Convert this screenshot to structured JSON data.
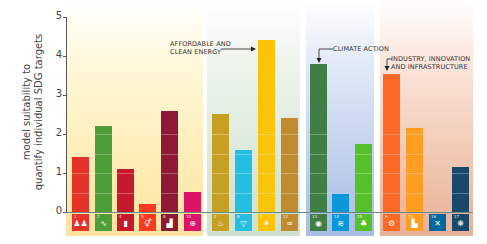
{
  "chart_data": {
    "type": "bar",
    "title": "",
    "xlabel": "",
    "ylabel": "model suitability to quantify individual SDG targets",
    "ylim": [
      0,
      5
    ],
    "yticks": [
      0,
      1,
      2,
      3,
      4,
      5
    ],
    "grid": false,
    "legend": null,
    "categories": [
      "SDG 1",
      "SDG 2",
      "SDG 4",
      "SDG 5",
      "SDG 8",
      "SDG 10",
      "SDG 6",
      "SDG 14",
      "SDG 7",
      "SDG 12",
      "SDG 13",
      "SDG 14b",
      "SDG 15",
      "SDG 9",
      "SDG 11",
      "SDG 16",
      "SDG 17"
    ],
    "groups": [
      {
        "name": "social",
        "bars": [
          0,
          1,
          2,
          3,
          4,
          5
        ]
      },
      {
        "name": "resources",
        "bars": [
          6,
          7,
          8,
          9
        ]
      },
      {
        "name": "environment",
        "bars": [
          10,
          11,
          12
        ]
      },
      {
        "name": "infrastructure",
        "bars": [
          13,
          14,
          15,
          16
        ]
      }
    ],
    "values": [
      1.4,
      2.2,
      1.1,
      0.2,
      2.6,
      0.5,
      2.5,
      1.6,
      4.4,
      2.4,
      3.8,
      0.45,
      1.75,
      3.55,
      2.15,
      0.0,
      1.15
    ],
    "colors": [
      "#e5332a",
      "#4c9f38",
      "#c5192d",
      "#ff3a21",
      "#8f1838",
      "#dd1367",
      "#c5a023",
      "#26bde2",
      "#fcc30b",
      "#bf8b2e",
      "#3f7e44",
      "#0a97d9",
      "#56c02b",
      "#fd6925",
      "#fd9d24",
      "#00689d",
      "#19486a"
    ],
    "annotations": [
      {
        "text": "AFFORDABLE AND\nCLEAN ENERGY",
        "target_bar": 8
      },
      {
        "text": "CLIMATE ACTION",
        "target_bar": 10
      },
      {
        "text": "INDUSTRY, INNOVATION\nAND INFRASTRUCTURE",
        "target_bar": 13
      }
    ]
  },
  "axis": {
    "ylabel_line1": "model suitability to",
    "ylabel_line2": "quantify individual SDG targets",
    "ticks": [
      "0",
      "1",
      "2",
      "3",
      "4",
      "5"
    ]
  },
  "annotations": {
    "energy_line1": "AFFORDABLE AND",
    "energy_line2": "CLEAN ENERGY",
    "climate": "CLIMATE ACTION",
    "industry_line1": "INDUSTRY, INNOVATION",
    "industry_line2": "AND INFRASTRUCTURE"
  },
  "icons": [
    {
      "num": "1",
      "glyph": "♟♟"
    },
    {
      "num": "2",
      "glyph": "∿"
    },
    {
      "num": "4",
      "glyph": "▮"
    },
    {
      "num": "5",
      "glyph": "⚥"
    },
    {
      "num": "8",
      "glyph": "▟"
    },
    {
      "num": "10",
      "glyph": "⊕"
    },
    {
      "num": "2",
      "glyph": "♨"
    },
    {
      "num": "6",
      "glyph": "▽"
    },
    {
      "num": "7",
      "glyph": "☀"
    },
    {
      "num": "12",
      "glyph": "∞"
    },
    {
      "num": "13",
      "glyph": "◉"
    },
    {
      "num": "14",
      "glyph": "≋"
    },
    {
      "num": "15",
      "glyph": "♣"
    },
    {
      "num": "9",
      "glyph": "⚙"
    },
    {
      "num": "11",
      "glyph": "▙"
    },
    {
      "num": "16",
      "glyph": "✕"
    },
    {
      "num": "17",
      "glyph": "❋"
    }
  ]
}
